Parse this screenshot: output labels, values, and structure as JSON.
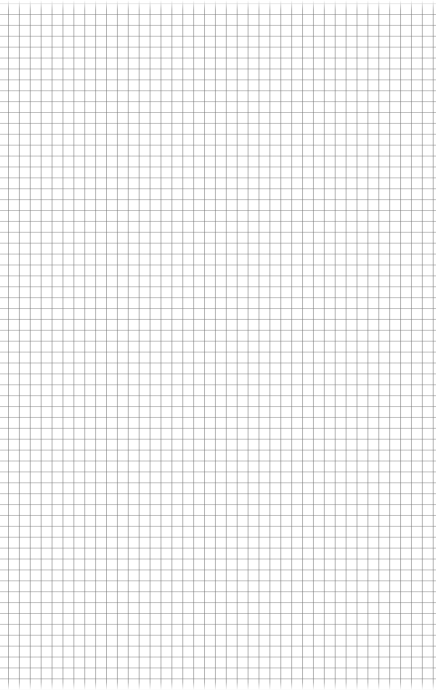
{
  "paper": {
    "type": "grid-paper",
    "grid_spacing_px": 10.9,
    "line_color": "#8a8a8a",
    "background_color": "#ffffff"
  }
}
